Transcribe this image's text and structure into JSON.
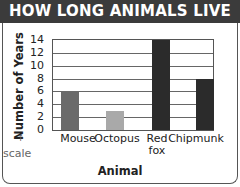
{
  "chart_data": {
    "type": "bar",
    "title": "HOW LONG ANIMALS LIVE",
    "xlabel": "Animal",
    "ylabel": "Number of Years",
    "categories": [
      "Mouse",
      "Octopus",
      "Red fox",
      "Chipmunk"
    ],
    "values": [
      6,
      3,
      14,
      8
    ],
    "bar_colors": [
      "#6a6a6a",
      "#a9a9a9",
      "#2b2b2b",
      "#2b2b2b"
    ],
    "ylim": [
      0,
      14
    ],
    "yticks": [
      0,
      2,
      4,
      6,
      8,
      10,
      12,
      14
    ],
    "grid": true,
    "legend": null,
    "annotations": [
      {
        "text": "scale",
        "points_to": "y-axis 0"
      }
    ]
  },
  "labels": {
    "title": "HOW LONG ANIMALS LIVE",
    "ylabel": "Number of Years",
    "xlabel": "Animal",
    "scale_note": "scale",
    "scale_arrow": "↑",
    "x_ticks": [
      "Mouse",
      "Octopus",
      "Red\nfox",
      "Chipmunk"
    ],
    "y_ticks": [
      "0",
      "2",
      "4",
      "6",
      "8",
      "10",
      "12",
      "14"
    ]
  }
}
